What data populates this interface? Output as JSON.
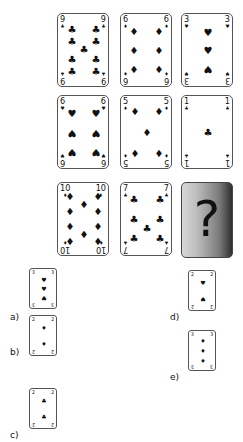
{
  "puzzle": {
    "question_mark": "?",
    "grid": [
      {
        "rank": "9",
        "suit": "clubs",
        "glyph": "♣"
      },
      {
        "rank": "6",
        "suit": "diamonds",
        "glyph": "♦"
      },
      {
        "rank": "3",
        "suit": "hearts",
        "glyph": "♥"
      },
      {
        "rank": "6",
        "suit": "hearts",
        "glyph": "♥"
      },
      {
        "rank": "5",
        "suit": "diamonds",
        "glyph": "♦"
      },
      {
        "rank": "1",
        "suit": "clubs",
        "glyph": "♣"
      },
      {
        "rank": "10",
        "suit": "diamonds",
        "glyph": "♦"
      },
      {
        "rank": "7",
        "suit": "clubs",
        "glyph": "♣"
      },
      {
        "rank": "?",
        "suit": "unknown",
        "glyph": "?"
      }
    ]
  },
  "options": [
    {
      "label": "a)",
      "rank": "3",
      "suit": "hearts",
      "glyph": "♥"
    },
    {
      "label": "b)",
      "rank": "2",
      "suit": "diamonds",
      "glyph": "♦"
    },
    {
      "label": "c)",
      "rank": "2",
      "suit": "clubs",
      "glyph": "♣"
    },
    {
      "label": "d)",
      "rank": "2",
      "suit": "hearts",
      "glyph": "♥"
    },
    {
      "label": "e)",
      "rank": "3",
      "suit": "diamonds",
      "glyph": "♦"
    }
  ]
}
